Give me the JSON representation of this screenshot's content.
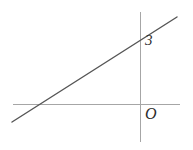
{
  "figure": {
    "background_color": "#ffffff",
    "width": 193,
    "height": 150,
    "axis_color": "#a6a6a6",
    "line_color": "#555555",
    "label_color": "#2b2b2b"
  },
  "labels": {
    "y_intercept": "3",
    "origin": "O"
  },
  "chart_data": {
    "type": "line",
    "title": "",
    "xlabel": "",
    "ylabel": "",
    "grid": false,
    "legend": "none",
    "axes": {
      "x_axis": {
        "pixel_y": 104,
        "pixel_x_start": 13,
        "pixel_x_end": 180,
        "color": "#a6a6a6"
      },
      "y_axis": {
        "pixel_x": 140,
        "pixel_y_start": 12,
        "pixel_y_end": 142,
        "color": "#a6a6a6"
      }
    },
    "series": [
      {
        "name": "line",
        "color": "#555555",
        "points_pixel": [
          [
            12,
            122
          ],
          [
            177,
            17
          ]
        ],
        "y_intercept_value": 3,
        "y_intercept_pixel": [
          140,
          35
        ],
        "x_intercept_pixel": [
          84,
          104
        ],
        "slope_sign": "positive"
      }
    ],
    "annotations": [
      {
        "text": "3",
        "pixel": [
          145,
          41
        ],
        "describes": "y-intercept value"
      },
      {
        "text": "O",
        "pixel": [
          147,
          115
        ],
        "describes": "origin"
      }
    ]
  }
}
